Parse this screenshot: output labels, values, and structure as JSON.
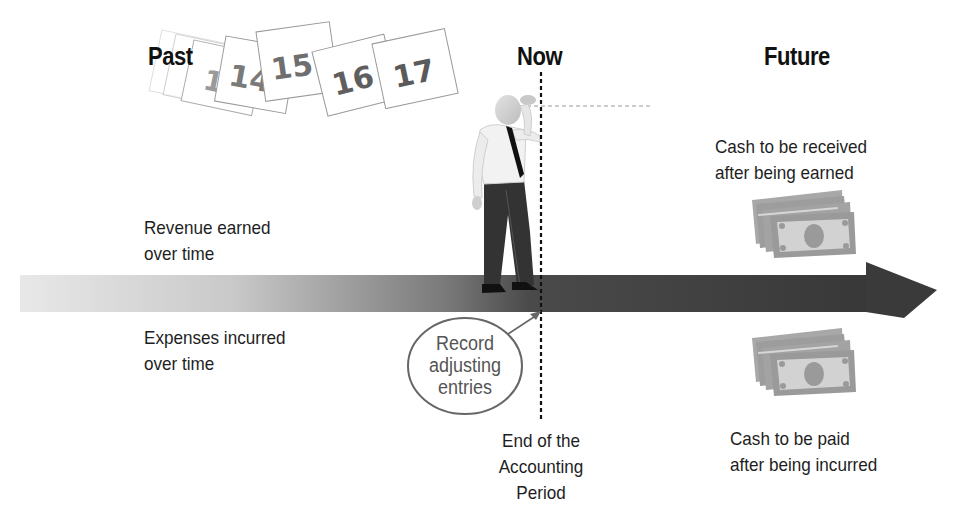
{
  "headings": {
    "past": "Past",
    "now": "Now",
    "future": "Future"
  },
  "calendar_pages": [
    "13",
    "14",
    "15",
    "16",
    "17"
  ],
  "labels": {
    "revenue_line1": "Revenue earned",
    "revenue_line2": "over time",
    "expenses_line1": "Expenses incurred",
    "expenses_line2": "over time",
    "cash_received_line1": "Cash to be received",
    "cash_received_line2": "after being earned",
    "cash_paid_line1": "Cash to be paid",
    "cash_paid_line2": "after being incurred",
    "period_end_line1": "End of the",
    "period_end_line2": "Accounting",
    "period_end_line3": "Period"
  },
  "callout": {
    "line1": "Record",
    "line2": "adjusting",
    "line3": "entries"
  },
  "icons": {
    "timeline": "timeline-arrow-icon",
    "person": "man-looking-ahead-icon",
    "money_top": "cash-stack-icon",
    "money_bottom": "cash-stack-icon",
    "calendar": "calendar-page-icon"
  },
  "colors": {
    "arrow_start": "#e6e6e6",
    "arrow_mid": "#8c8c8c",
    "arrow_end": "#3a3a3a",
    "money": "#9a9a9a",
    "money_light": "#d2d2d2",
    "text": "#1e1e1e",
    "callout_text": "#555555"
  }
}
